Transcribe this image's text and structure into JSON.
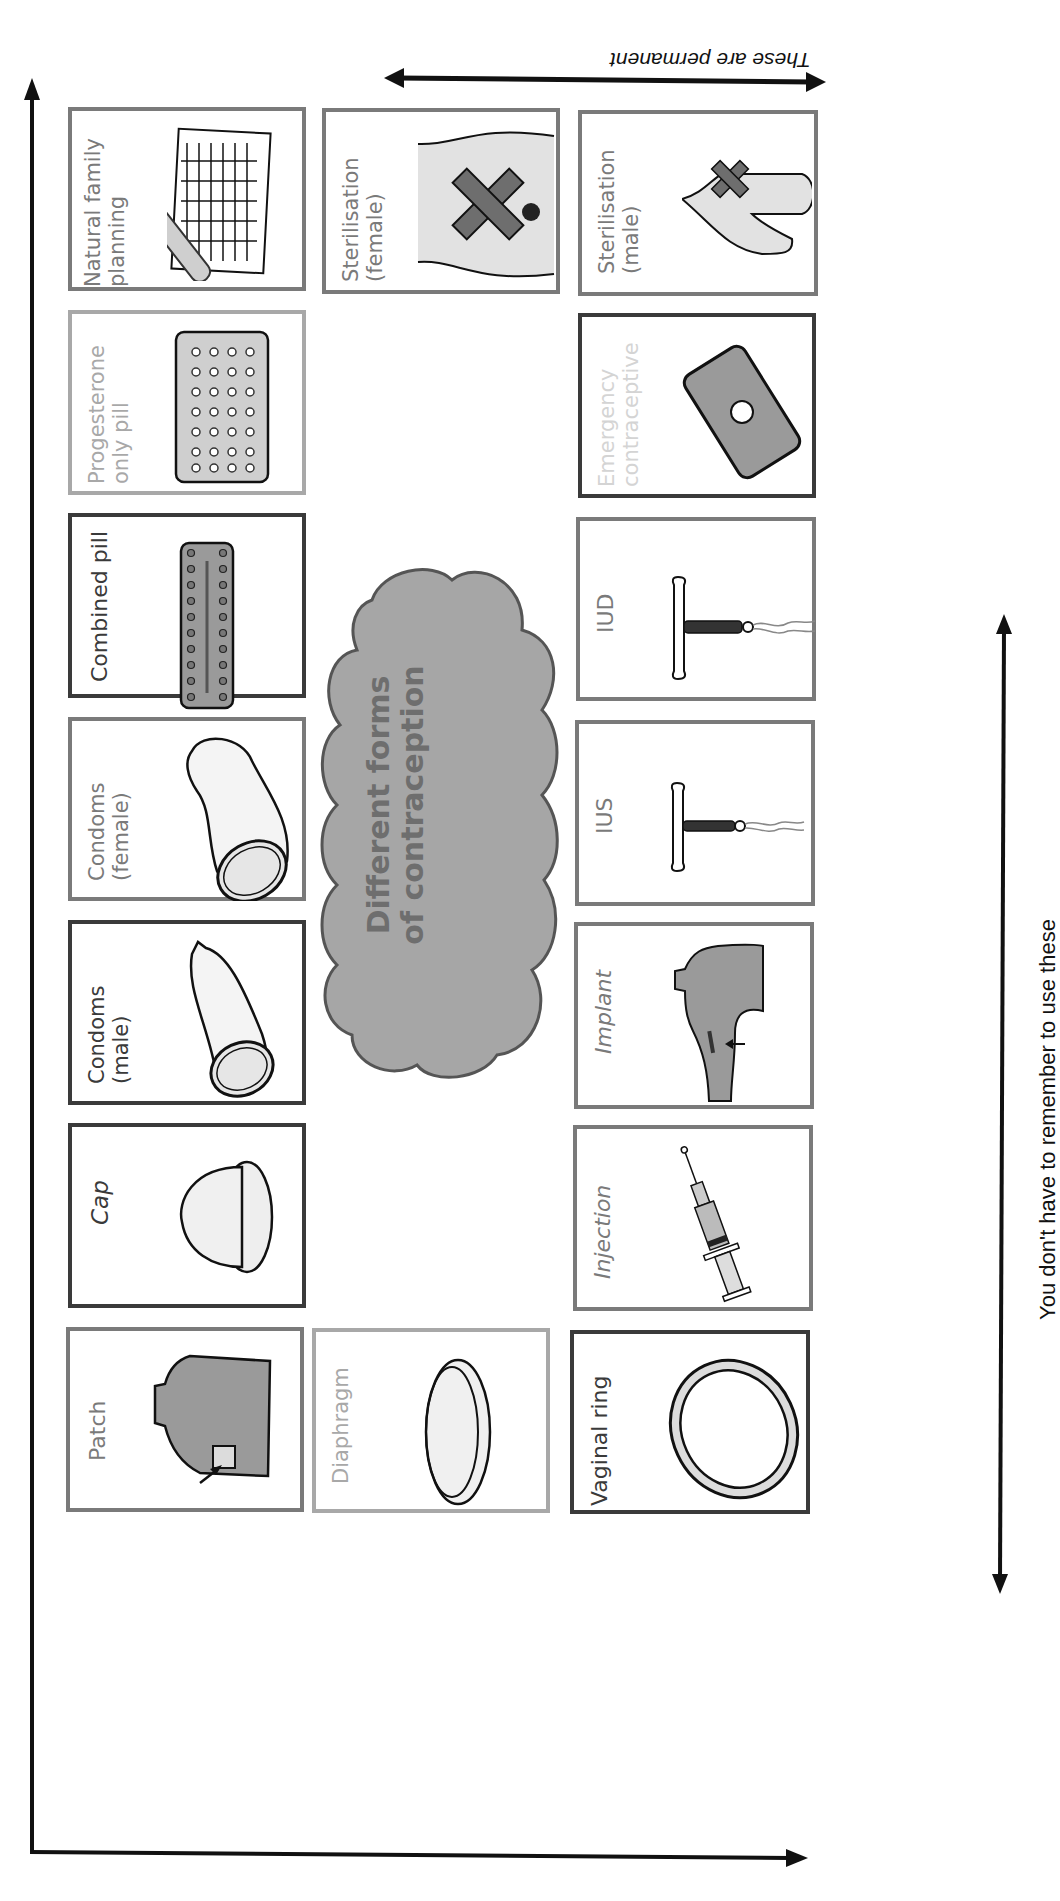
{
  "title": "Different forms\nof contraception",
  "annotations": {
    "permanent": "These are permanent",
    "no_remember": "You don't have to remember to use these"
  },
  "colors": {
    "border_dark": "#3a3a3a",
    "border_mid": "#7a7a7a",
    "border_light": "#a8a8a8",
    "fill_gray": "#9a9a9a",
    "fill_light": "#dcdcdc",
    "cloud_fill": "#a6a6a6",
    "cloud_stroke": "#555555"
  },
  "cards": {
    "natural_family_planning": {
      "label": "Natural family\nplanning",
      "icon": "thermometer-chart-icon"
    },
    "progesterone_only_pill": {
      "label": "Progesterone\nonly pill",
      "icon": "pill-pack-icon"
    },
    "combined_pill": {
      "label": "Combined pill",
      "icon": "combined-pill-pack-icon"
    },
    "condoms_female": {
      "label": "Condoms\n(female)",
      "icon": "female-condom-icon"
    },
    "condoms_male": {
      "label": "Condoms\n(male)",
      "icon": "male-condom-icon"
    },
    "cap": {
      "label": "Cap",
      "icon": "cervical-cap-icon"
    },
    "patch": {
      "label": "Patch",
      "icon": "skin-patch-icon"
    },
    "sterilisation_female": {
      "label": "Sterilisation\n(female)",
      "icon": "fallopian-cross-icon"
    },
    "diaphragm": {
      "label": "Diaphragm",
      "icon": "diaphragm-icon"
    },
    "sterilisation_male": {
      "label": "Sterilisation\n(male)",
      "icon": "vas-cross-icon"
    },
    "emergency_contraceptive": {
      "label": "Emergency\ncontraceptive",
      "icon": "single-pill-icon"
    },
    "iud": {
      "label": "IUD",
      "icon": "iud-icon"
    },
    "ius": {
      "label": "IUS",
      "icon": "ius-icon"
    },
    "implant": {
      "label": "Implant",
      "icon": "arm-implant-icon"
    },
    "injection": {
      "label": "Injection",
      "icon": "syringe-icon"
    },
    "vaginal_ring": {
      "label": "Vaginal ring",
      "icon": "ring-icon"
    }
  }
}
